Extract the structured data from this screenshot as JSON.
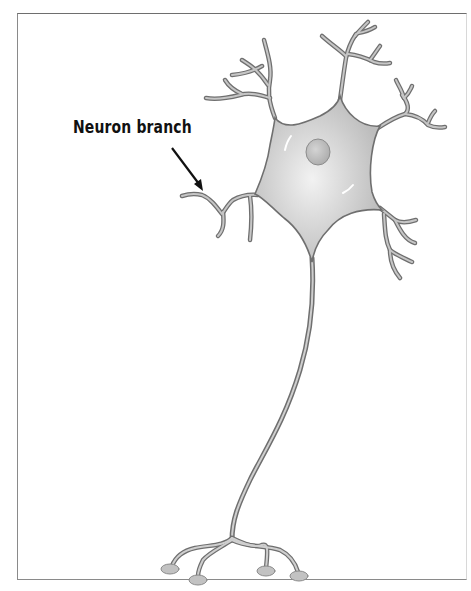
{
  "diagram": {
    "subject": "neuron",
    "label": {
      "text": "Neuron branch",
      "points_to": "dendrite"
    },
    "parts_depicted": [
      "cell body (soma)",
      "nucleus",
      "dendrites",
      "axon",
      "axon terminals"
    ],
    "colors": {
      "background": "#ffffff",
      "frame": "#7a7a7a",
      "membrane_outline": "#6f6f6f",
      "cytoplasm_fill": "#c8c8c8",
      "cytoplasm_highlight": "#ececec",
      "nucleus_fill": "#b9b9b9",
      "label_text": "#111111",
      "arrow": "#111111"
    }
  }
}
